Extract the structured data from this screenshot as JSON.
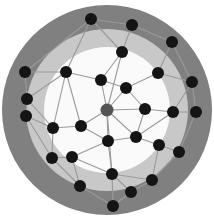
{
  "figure": {
    "width": 214,
    "height": 219,
    "background_color": "#ffffff"
  },
  "chart_data": {
    "type": "scatter",
    "title": "",
    "subtitle": "",
    "xlabel": "",
    "ylabel": "",
    "grid": false,
    "legend_position": "none",
    "xlim": [
      0,
      214
    ],
    "ylim": [
      0,
      219
    ],
    "layout": "concentric-rings",
    "center": {
      "x": 107,
      "y": 110
    },
    "rings": [
      {
        "name": "outer-ring",
        "shell_index": 3,
        "outer_radius": 105,
        "inner_radius": 81,
        "fill": "#808080",
        "node_count": 13
      },
      {
        "name": "middle-ring",
        "shell_index": 2,
        "outer_radius": 81,
        "inner_radius": 63,
        "fill": "#c8c8c8",
        "node_count": 8
      },
      {
        "name": "inner-core",
        "shell_index": 1,
        "outer_radius": 63,
        "inner_radius": 0,
        "fill": "#fafafa",
        "node_count": 7
      }
    ],
    "node_style": {
      "default_color": "#141414",
      "hub_color": "#555555",
      "radius": 6,
      "hub_radius": 6.5
    },
    "edge_style": {
      "color": "#9a9a9a",
      "width": 1.1
    },
    "nodes": [
      {
        "id": "c0",
        "x": 107,
        "y": 110,
        "shell": 1,
        "color": "#555555",
        "role": "hub"
      },
      {
        "id": "i1",
        "x": 101,
        "y": 80,
        "shell": 1,
        "color": "#141414",
        "role": "inner"
      },
      {
        "id": "i2",
        "x": 126,
        "y": 88,
        "shell": 1,
        "color": "#141414",
        "role": "inner"
      },
      {
        "id": "i3",
        "x": 145,
        "y": 109,
        "shell": 1,
        "color": "#141414",
        "role": "inner"
      },
      {
        "id": "i4",
        "x": 81,
        "y": 126,
        "shell": 1,
        "color": "#141414",
        "role": "inner"
      },
      {
        "id": "i5",
        "x": 108,
        "y": 141,
        "shell": 1,
        "color": "#141414",
        "role": "inner"
      },
      {
        "id": "i6",
        "x": 136,
        "y": 137,
        "shell": 1,
        "color": "#141414",
        "role": "inner"
      },
      {
        "id": "m1",
        "x": 66,
        "y": 72,
        "shell": 2,
        "color": "#141414",
        "role": "middle"
      },
      {
        "id": "m2",
        "x": 122,
        "y": 52,
        "shell": 2,
        "color": "#141414",
        "role": "middle"
      },
      {
        "id": "m3",
        "x": 158,
        "y": 73,
        "shell": 2,
        "color": "#141414",
        "role": "middle"
      },
      {
        "id": "m4",
        "x": 173,
        "y": 112,
        "shell": 2,
        "color": "#141414",
        "role": "middle"
      },
      {
        "id": "m5",
        "x": 159,
        "y": 145,
        "shell": 2,
        "color": "#141414",
        "role": "middle"
      },
      {
        "id": "m6",
        "x": 112,
        "y": 174,
        "shell": 2,
        "color": "#141414",
        "role": "middle"
      },
      {
        "id": "m7",
        "x": 72,
        "y": 157,
        "shell": 2,
        "color": "#141414",
        "role": "middle"
      },
      {
        "id": "m8",
        "x": 53,
        "y": 128,
        "shell": 2,
        "color": "#141414",
        "role": "middle"
      },
      {
        "id": "o1",
        "x": 91,
        "y": 19,
        "shell": 3,
        "color": "#141414",
        "role": "outer"
      },
      {
        "id": "o2",
        "x": 132,
        "y": 25,
        "shell": 3,
        "color": "#141414",
        "role": "outer"
      },
      {
        "id": "o3",
        "x": 172,
        "y": 42,
        "shell": 3,
        "color": "#141414",
        "role": "outer"
      },
      {
        "id": "o4",
        "x": 192,
        "y": 82,
        "shell": 3,
        "color": "#141414",
        "role": "outer"
      },
      {
        "id": "o5",
        "x": 196,
        "y": 112,
        "shell": 3,
        "color": "#141414",
        "role": "outer"
      },
      {
        "id": "o6",
        "x": 179,
        "y": 152,
        "shell": 3,
        "color": "#141414",
        "role": "outer"
      },
      {
        "id": "o7",
        "x": 152,
        "y": 180,
        "shell": 3,
        "color": "#141414",
        "role": "outer"
      },
      {
        "id": "o8",
        "x": 131,
        "y": 192,
        "shell": 3,
        "color": "#141414",
        "role": "outer"
      },
      {
        "id": "o9",
        "x": 113,
        "y": 206,
        "shell": 3,
        "color": "#141414",
        "role": "outer"
      },
      {
        "id": "o10",
        "x": 80,
        "y": 186,
        "shell": 3,
        "color": "#141414",
        "role": "outer"
      },
      {
        "id": "o11",
        "x": 52,
        "y": 158,
        "shell": 3,
        "color": "#141414",
        "role": "outer"
      },
      {
        "id": "o12",
        "x": 26,
        "y": 116,
        "shell": 3,
        "color": "#141414",
        "role": "outer"
      },
      {
        "id": "o13",
        "x": 27,
        "y": 99,
        "shell": 3,
        "color": "#141414",
        "role": "outer"
      },
      {
        "id": "o14",
        "x": 25,
        "y": 72,
        "shell": 3,
        "color": "#141414",
        "role": "outer"
      }
    ],
    "edges": [
      [
        "c0",
        "i1"
      ],
      [
        "c0",
        "i2"
      ],
      [
        "c0",
        "i3"
      ],
      [
        "c0",
        "i4"
      ],
      [
        "c0",
        "i5"
      ],
      [
        "c0",
        "i6"
      ],
      [
        "c0",
        "m2"
      ],
      [
        "c0",
        "m6"
      ],
      [
        "i1",
        "i2"
      ],
      [
        "i1",
        "m1"
      ],
      [
        "i1",
        "m2"
      ],
      [
        "i2",
        "i3"
      ],
      [
        "i2",
        "m3"
      ],
      [
        "i3",
        "m4"
      ],
      [
        "i3",
        "i6"
      ],
      [
        "i4",
        "i5"
      ],
      [
        "i4",
        "m8"
      ],
      [
        "i4",
        "m1"
      ],
      [
        "i5",
        "i6"
      ],
      [
        "i5",
        "m6"
      ],
      [
        "i5",
        "m7"
      ],
      [
        "i6",
        "m5"
      ],
      [
        "i6",
        "m4"
      ],
      [
        "m1",
        "o1"
      ],
      [
        "m1",
        "o14"
      ],
      [
        "m1",
        "m8"
      ],
      [
        "m2",
        "o1"
      ],
      [
        "m2",
        "o2"
      ],
      [
        "m3",
        "o3"
      ],
      [
        "m3",
        "o4"
      ],
      [
        "m4",
        "o5"
      ],
      [
        "m4",
        "o4"
      ],
      [
        "m5",
        "o6"
      ],
      [
        "m5",
        "o7"
      ],
      [
        "m6",
        "o8"
      ],
      [
        "m6",
        "o9"
      ],
      [
        "m6",
        "m7"
      ],
      [
        "m7",
        "o10"
      ],
      [
        "m7",
        "o11"
      ],
      [
        "m8",
        "o11"
      ],
      [
        "m8",
        "o12"
      ],
      [
        "m8",
        "o13"
      ],
      [
        "o1",
        "o2"
      ],
      [
        "o2",
        "o3"
      ],
      [
        "o3",
        "o4"
      ],
      [
        "o4",
        "o5"
      ],
      [
        "o5",
        "o6"
      ],
      [
        "o6",
        "o7"
      ],
      [
        "o7",
        "o8"
      ],
      [
        "o8",
        "o9"
      ],
      [
        "o9",
        "o10"
      ],
      [
        "o10",
        "o11"
      ],
      [
        "o11",
        "o12"
      ],
      [
        "o12",
        "o13"
      ],
      [
        "o13",
        "o14"
      ],
      [
        "o14",
        "o1"
      ],
      [
        "o13",
        "m1"
      ],
      [
        "o9",
        "o8"
      ],
      [
        "o7",
        "m6"
      ]
    ]
  }
}
